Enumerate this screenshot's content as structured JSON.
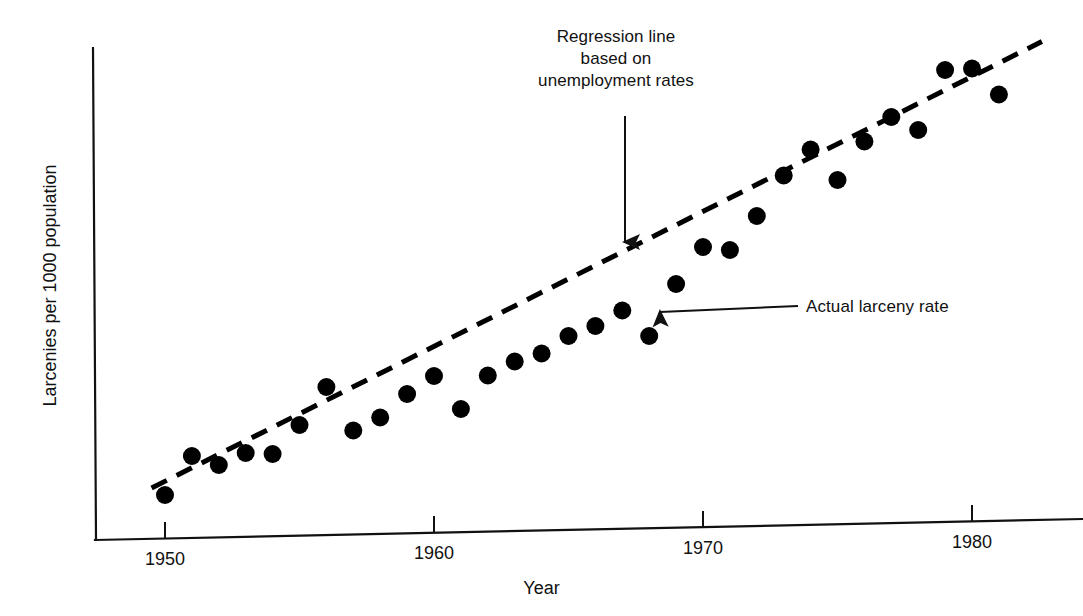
{
  "chart_data": {
    "type": "scatter",
    "title": "",
    "xlabel": "Year",
    "ylabel": "Larcenies per 1000 population",
    "xlim": [
      1949,
      1982
    ],
    "ylim": [
      0,
      10
    ],
    "xticks": [
      "1950",
      "1960",
      "1970",
      "1980"
    ],
    "xtick_values": [
      1950,
      1960,
      1970,
      1980
    ],
    "yticks": [],
    "grid": false,
    "legend_position": "none",
    "series": [
      {
        "name": "Actual larceny rate",
        "type": "scatter",
        "marker": "filled-circle",
        "color": "#000000",
        "x": [
          1950,
          1951,
          1952,
          1953,
          1954,
          1955,
          1956,
          1957,
          1958,
          1959,
          1960,
          1961,
          1962,
          1963,
          1964,
          1965,
          1966,
          1967,
          1968,
          1969,
          1970,
          1971,
          1972,
          1973,
          1974,
          1975,
          1976,
          1977,
          1978,
          1979,
          1980,
          1981
        ],
        "y": [
          0.9,
          1.68,
          1.5,
          1.74,
          1.72,
          2.3,
          3.06,
          2.19,
          2.45,
          2.92,
          3.28,
          2.62,
          3.29,
          3.57,
          3.73,
          4.08,
          4.28,
          4.59,
          4.08,
          5.12,
          5.86,
          5.8,
          6.48,
          7.29,
          7.81,
          7.2,
          7.97,
          8.46,
          8.2,
          9.4,
          9.43,
          8.91
        ]
      },
      {
        "name": "Regression line based on unemployment rates",
        "type": "line",
        "style": "dashed",
        "color": "#000000",
        "x": [
          1949.5,
          1982.6
        ],
        "y": [
          1.04,
          9.97
        ]
      }
    ],
    "annotations": [
      {
        "name": "regression-line-annotation",
        "lines": [
          "Regression line",
          "based on",
          "unemployment rates"
        ],
        "arrow": "down",
        "target_x": 1967.1,
        "target_y": 6.02
      },
      {
        "name": "actual-larceny-annotation",
        "lines": [
          "Actual larceny rate"
        ],
        "arrow": "left",
        "target_x": 1967.8,
        "target_y": 4.62
      }
    ]
  },
  "axis": {
    "x_label": "Year",
    "y_label": "Larcenies per 1000 population",
    "ticks": [
      {
        "label": "1950",
        "px": 165
      },
      {
        "label": "1960",
        "px": 434
      },
      {
        "label": "1970",
        "px": 703
      },
      {
        "label": "1980",
        "px": 972
      }
    ]
  },
  "annotations": {
    "regression": {
      "line1": "Regression line",
      "line2": "based on",
      "line3": "unemployment rates"
    },
    "actual": {
      "label": "Actual larceny rate"
    }
  },
  "colors": {
    "ink": "#000000",
    "background": "#ffffff"
  }
}
